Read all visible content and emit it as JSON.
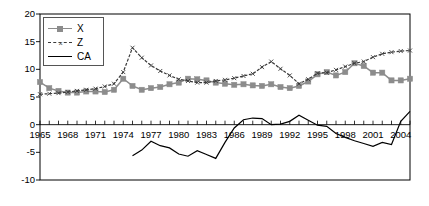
{
  "chart_data": {
    "type": "line",
    "title": "",
    "xlabel": "",
    "ylabel": "",
    "xlim": [
      1965,
      2005
    ],
    "ylim": [
      -10,
      20
    ],
    "ytick_labels": [
      "20",
      "15",
      "10",
      "5",
      "0",
      "-5",
      "-10"
    ],
    "ytick_values": [
      20,
      15,
      10,
      5,
      0,
      -5,
      -10
    ],
    "xtick_labels": [
      "1965",
      "1968",
      "1971",
      "1974",
      "1977",
      "1980",
      "1983",
      "1986",
      "1989",
      "1992",
      "1995",
      "1998",
      "2001",
      "2004"
    ],
    "xtick_values": [
      1965,
      1968,
      1971,
      1974,
      1977,
      1980,
      1983,
      1986,
      1989,
      1992,
      1995,
      1998,
      2001,
      2004
    ],
    "minor_tick_interval": 1,
    "grid": false,
    "legend_position": "top-left",
    "x": [
      1965,
      1966,
      1967,
      1968,
      1969,
      1970,
      1971,
      1972,
      1973,
      1974,
      1975,
      1976,
      1977,
      1978,
      1979,
      1980,
      1981,
      1982,
      1983,
      1984,
      1985,
      1986,
      1987,
      1988,
      1989,
      1990,
      1991,
      1992,
      1993,
      1994,
      1995,
      1996,
      1997,
      1998,
      1999,
      2000,
      2001,
      2002,
      2003,
      2004,
      2005
    ],
    "series": [
      {
        "name": "X",
        "color": "#8c8c8c",
        "marker": "square",
        "values": [
          7.7,
          6.6,
          6.1,
          5.8,
          5.8,
          6.0,
          6.0,
          5.9,
          6.3,
          8.3,
          7.0,
          6.3,
          6.6,
          6.8,
          7.3,
          7.6,
          8.3,
          8.2,
          8.0,
          7.6,
          7.4,
          7.2,
          7.3,
          7.1,
          7.0,
          7.3,
          6.8,
          6.6,
          7.0,
          7.8,
          9.1,
          9.5,
          8.9,
          9.5,
          11.1,
          10.6,
          9.4,
          9.4,
          8.0,
          8.0,
          8.3
        ]
      },
      {
        "name": "Z",
        "color": "#3a3a3a",
        "marker": "x",
        "dashed": true,
        "values": [
          5.5,
          5.6,
          5.7,
          5.9,
          6.1,
          6.3,
          6.5,
          6.9,
          7.4,
          9.5,
          13.9,
          12.1,
          10.7,
          9.7,
          8.9,
          8.2,
          7.9,
          7.6,
          7.6,
          7.9,
          8.1,
          8.4,
          8.8,
          9.2,
          10.4,
          11.4,
          10.1,
          8.9,
          7.4,
          8.2,
          9.3,
          9.4,
          9.9,
          10.5,
          11.1,
          11.4,
          12.2,
          12.8,
          13.1,
          13.3,
          13.4
        ]
      },
      {
        "name": "CA",
        "color": "#000000",
        "marker": "none",
        "values": [
          null,
          null,
          null,
          null,
          null,
          null,
          null,
          null,
          null,
          null,
          -5.6,
          -4.6,
          -3.0,
          -3.8,
          -4.2,
          -5.3,
          -5.7,
          -4.7,
          -5.4,
          -6.1,
          -3.2,
          -0.6,
          0.9,
          1.2,
          1.1,
          0.0,
          0.1,
          0.6,
          1.7,
          0.8,
          -0.1,
          -0.3,
          -1.6,
          -2.3,
          -2.9,
          -3.4,
          -3.9,
          -3.2,
          -3.6,
          0.6,
          2.4
        ]
      }
    ]
  },
  "legend": {
    "items": [
      {
        "label": "X"
      },
      {
        "label": "Z"
      },
      {
        "label": "CA"
      }
    ]
  },
  "axes": {
    "y_labels": [
      "20",
      "15",
      "10",
      "5",
      "0",
      "-5",
      "-10"
    ],
    "x_labels": [
      "1965",
      "1968",
      "1971",
      "1974",
      "1977",
      "1980",
      "1983",
      "1986",
      "1989",
      "1992",
      "1995",
      "1998",
      "2001",
      "2004"
    ]
  }
}
